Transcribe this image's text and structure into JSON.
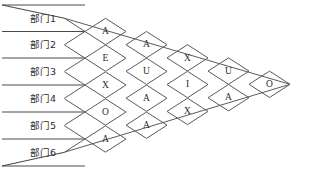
{
  "chart_data": {
    "type": "diagram",
    "title": "",
    "subtype": "relationship-chart-rel-diagram",
    "departments": [
      "部门1",
      "部门2",
      "部门3",
      "部门4",
      "部门5",
      "部门6"
    ],
    "rating_codes": [
      "A",
      "E",
      "I",
      "O",
      "U",
      "X"
    ],
    "columns": [
      {
        "index": 1,
        "pairs": [
          "1-2",
          "2-3",
          "3-4",
          "4-5",
          "5-6"
        ],
        "values": [
          "A",
          "E",
          "X",
          "O",
          "A"
        ]
      },
      {
        "index": 2,
        "pairs": [
          "1-3",
          "2-4",
          "3-5",
          "4-6"
        ],
        "values": [
          "A",
          "U",
          "A",
          "A"
        ]
      },
      {
        "index": 3,
        "pairs": [
          "1-4",
          "2-5",
          "3-6"
        ],
        "values": [
          "X",
          "I",
          "X"
        ]
      },
      {
        "index": 4,
        "pairs": [
          "1-5",
          "2-6"
        ],
        "values": [
          "U",
          "A"
        ]
      },
      {
        "index": 5,
        "pairs": [
          "1-6"
        ],
        "values": [
          "O"
        ]
      }
    ],
    "cells": [
      {
        "row": 1,
        "col": 1,
        "value": "A",
        "pair": "1-2"
      },
      {
        "row": 2,
        "col": 1,
        "value": "E",
        "pair": "2-3"
      },
      {
        "row": 3,
        "col": 1,
        "value": "X",
        "pair": "3-4"
      },
      {
        "row": 4,
        "col": 1,
        "value": "O",
        "pair": "4-5"
      },
      {
        "row": 5,
        "col": 1,
        "value": "A",
        "pair": "5-6"
      },
      {
        "row": 1,
        "col": 2,
        "value": "A",
        "pair": "1-3"
      },
      {
        "row": 2,
        "col": 2,
        "value": "U",
        "pair": "2-4"
      },
      {
        "row": 3,
        "col": 2,
        "value": "A",
        "pair": "3-5"
      },
      {
        "row": 4,
        "col": 2,
        "value": "A",
        "pair": "4-6"
      },
      {
        "row": 1,
        "col": 3,
        "value": "X",
        "pair": "1-4"
      },
      {
        "row": 2,
        "col": 3,
        "value": "I",
        "pair": "2-5"
      },
      {
        "row": 3,
        "col": 3,
        "value": "X",
        "pair": "3-6"
      },
      {
        "row": 1,
        "col": 4,
        "value": "U",
        "pair": "1-5"
      },
      {
        "row": 2,
        "col": 4,
        "value": "A",
        "pair": "2-6"
      },
      {
        "row": 1,
        "col": 5,
        "value": "O",
        "pair": "1-6"
      }
    ],
    "colors": {
      "line": "#5a5a5a",
      "text": "#2b2b2b",
      "background": "#ffffff"
    },
    "geometry": {
      "row_rule_y": [
        5,
        31.5,
        58,
        85,
        112,
        139,
        166
      ],
      "label_x": 30,
      "fan_origin_x": 85,
      "half_w": 20.5,
      "half_h": 13.2
    }
  }
}
